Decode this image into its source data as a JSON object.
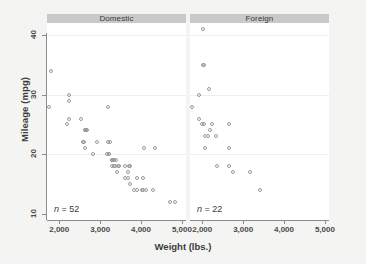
{
  "chart_data": {
    "type": "scatter",
    "title": "",
    "xlabel": "Weight (lbs.)",
    "ylabel": "Mileage (mpg)",
    "xlim": [
      1700,
      5100
    ],
    "ylim": [
      9,
      42
    ],
    "xticks": [
      2000,
      3000,
      4000,
      5000
    ],
    "xticklabels": [
      "2,000",
      "3,000",
      "4,000",
      "5,000"
    ],
    "yticks": [
      10,
      20,
      30,
      40
    ],
    "yticklabels": [
      "10",
      "20",
      "30",
      "40"
    ],
    "grid": "horizontal",
    "gridlines_y": [
      20,
      30,
      40
    ],
    "legend": "none",
    "facet_by": "Car origin",
    "panels": [
      {
        "label": "Domestic",
        "annotation": "n = 52",
        "annotation_prefix": "n",
        "annotation_value": "= 52",
        "n": 52,
        "points": [
          [
            1800,
            34
          ],
          [
            1760,
            28
          ],
          [
            2230,
            29
          ],
          [
            2230,
            30
          ],
          [
            2200,
            25
          ],
          [
            2230,
            26
          ],
          [
            2520,
            26
          ],
          [
            2650,
            24
          ],
          [
            2670,
            24
          ],
          [
            3180,
            28
          ],
          [
            2580,
            22
          ],
          [
            2600,
            22
          ],
          [
            2640,
            21
          ],
          [
            2830,
            20
          ],
          [
            2930,
            22
          ],
          [
            3200,
            22
          ],
          [
            3250,
            22
          ],
          [
            3220,
            20
          ],
          [
            3210,
            20
          ],
          [
            3280,
            19
          ],
          [
            3330,
            19
          ],
          [
            3380,
            19
          ],
          [
            3300,
            18
          ],
          [
            3350,
            18
          ],
          [
            3430,
            18
          ],
          [
            3470,
            18
          ],
          [
            3600,
            18
          ],
          [
            3700,
            18
          ],
          [
            3740,
            18
          ],
          [
            3420,
            17
          ],
          [
            3600,
            16
          ],
          [
            3670,
            16
          ],
          [
            3900,
            16
          ],
          [
            4060,
            16
          ],
          [
            3740,
            15
          ],
          [
            3830,
            14
          ],
          [
            3900,
            14
          ],
          [
            4030,
            14
          ],
          [
            4060,
            14
          ],
          [
            4130,
            14
          ],
          [
            4290,
            14
          ],
          [
            4080,
            21
          ],
          [
            4330,
            21
          ],
          [
            4720,
            12
          ],
          [
            4840,
            12
          ],
          [
            3690,
            17
          ],
          [
            3280,
            19
          ],
          [
            3310,
            19
          ],
          [
            3360,
            18
          ],
          [
            3170,
            20
          ],
          [
            2640,
            24
          ],
          [
            2620,
            24
          ]
        ]
      },
      {
        "label": "Foreign",
        "annotation": "n = 22",
        "annotation_prefix": "n",
        "annotation_value": "= 22",
        "n": 22,
        "points": [
          [
            2020,
            41
          ],
          [
            2010,
            35
          ],
          [
            2040,
            35
          ],
          [
            2160,
            31
          ],
          [
            1930,
            30
          ],
          [
            1760,
            28
          ],
          [
            1930,
            26
          ],
          [
            1990,
            25
          ],
          [
            2050,
            25
          ],
          [
            2240,
            25
          ],
          [
            2650,
            25
          ],
          [
            2200,
            24
          ],
          [
            2070,
            23
          ],
          [
            2130,
            23
          ],
          [
            2330,
            23
          ],
          [
            2070,
            21
          ],
          [
            2650,
            21
          ],
          [
            2370,
            18
          ],
          [
            2650,
            18
          ],
          [
            2750,
            17
          ],
          [
            3170,
            17
          ],
          [
            3420,
            14
          ]
        ]
      }
    ]
  }
}
